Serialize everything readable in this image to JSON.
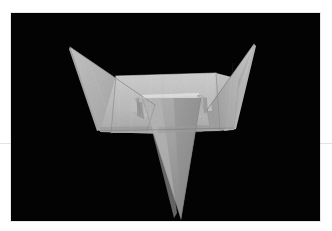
{
  "image": {
    "title": "Folded paper model on black background",
    "subject": "origami-paper-sculpture",
    "canvas": {
      "width": 332,
      "height": 231,
      "background": "#ffffff"
    },
    "plate": {
      "x": 11,
      "y": 13,
      "width": 309,
      "height": 208,
      "background": "#030303",
      "description": "Black photographic backdrop filling the plate"
    },
    "margin_rule": {
      "y": 143,
      "color": "#e3e3e3",
      "description": "Faint light-gray horizontal line crossing the white margins at left and right"
    },
    "palette": {
      "backdrop_black": "#030303",
      "paper_lightest": "#d2d2d2",
      "paper_light": "#bdbdbd",
      "paper_mid": "#ababab",
      "paper_mid_dark": "#9a9a9a",
      "paper_dark": "#868686",
      "paper_darkest": "#6f6f6f",
      "crease_line": "#7d7d7d",
      "highlight_edge": "#e0e0e0"
    },
    "model": {
      "name": "paper-model",
      "description": "Sheet of light gray paper folded into a winged form: two upswept triangular wings at left and right, a broad horizontal pleated band across the middle, and a long narrow triangle pointing down from the center",
      "parts": [
        {
          "name": "left-wing",
          "tone": "#b4b4b4",
          "tip": [
            70,
            47
          ]
        },
        {
          "name": "right-wing",
          "tone": "#bdbdbd",
          "tip": [
            253,
            44
          ]
        },
        {
          "name": "horizontal-band",
          "tone": "#bfbfbf",
          "top": 61,
          "bottom": 128
        },
        {
          "name": "center-pleat",
          "tone": "#cfcfcf"
        },
        {
          "name": "center-spike",
          "tone": "#a6a6a6",
          "tip": [
            170,
            206
          ]
        }
      ]
    }
  }
}
